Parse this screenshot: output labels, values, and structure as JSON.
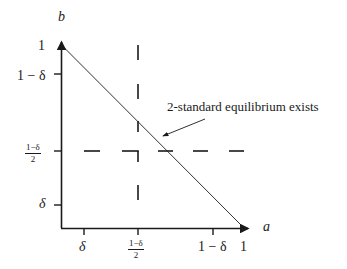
{
  "diagram": {
    "axes": {
      "x_label": "a",
      "y_label": "b",
      "x_ticks": [
        {
          "label": "δ"
        },
        {
          "label_num": "1−δ",
          "label_den": "2"
        },
        {
          "label": "1 − δ"
        },
        {
          "label": "1"
        }
      ],
      "y_ticks": [
        {
          "label": "1"
        },
        {
          "label": "1 − δ"
        },
        {
          "label_num": "1−δ",
          "label_den": "2"
        },
        {
          "label": "δ"
        }
      ]
    },
    "lines": {
      "diagonal": "b = 1 − a",
      "dashed_vertical": "a = (1−δ)/2",
      "dashed_horizontal": "b = (1−δ)/2"
    },
    "annotation": {
      "text": "2-standard equilibrium exists"
    },
    "colors": {
      "ink": "#1a1a1a",
      "background": "#ffffff"
    }
  }
}
